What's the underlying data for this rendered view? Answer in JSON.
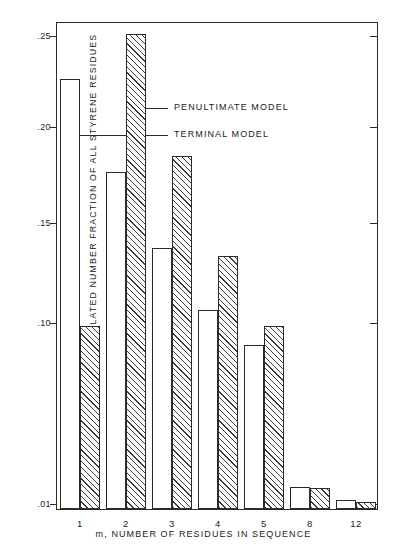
{
  "chart_data": {
    "type": "bar",
    "title": "",
    "xlabel": "m, NUMBER OF RESIDUES IN SEQUENCE",
    "ylabel": "CALCULATED NUMBER FRACTION OF ALL STYRENE RESIDUES",
    "categories": [
      "1",
      "2",
      "3",
      "4",
      "5",
      "8",
      "12"
    ],
    "ytick_labels": [
      ".25",
      ".20",
      ".15",
      ".10",
      ".01"
    ],
    "ytick_values": [
      0.25,
      0.2,
      0.15,
      0.1,
      0.01
    ],
    "ylim": [
      0.01,
      0.26
    ],
    "grid": false,
    "legend_position": "inline-annotation",
    "series": [
      {
        "name": "TERMINAL MODEL",
        "style": "open",
        "values": [
          0.2255,
          0.1755,
          0.1365,
          0.1055,
          0.088,
          0.0175,
          0.0108
        ]
      },
      {
        "name": "PENULTIMATE MODEL",
        "style": "hatched",
        "values": [
          0.0975,
          0.2545,
          0.184,
          0.1325,
          0.0975,
          0.017,
          0.01
        ]
      }
    ],
    "annotations": [
      {
        "label": "PENULTIMATE MODEL",
        "points_to": "m=2 hatched bar"
      },
      {
        "label": "TERMINAL MODEL",
        "points_to": "m=1 open bar"
      }
    ]
  }
}
